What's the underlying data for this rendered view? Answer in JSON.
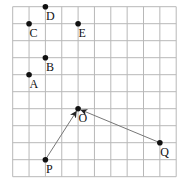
{
  "diagram": {
    "type": "coordinate-grid",
    "grid": {
      "columns": 10,
      "rows": 10,
      "origin_px": [
        12.7,
        6.7
      ],
      "cell_w": 16.35,
      "cell_h": 17.0,
      "line_color": "#b8b8b8"
    },
    "points": [
      {
        "label": "D",
        "col": 2,
        "row": 0
      },
      {
        "label": "C",
        "col": 1,
        "row": 1
      },
      {
        "label": "E",
        "col": 4,
        "row": 1
      },
      {
        "label": "B",
        "col": 2,
        "row": 3
      },
      {
        "label": "A",
        "col": 1,
        "row": 4
      },
      {
        "label": "O",
        "col": 4,
        "row": 6
      },
      {
        "label": "Q",
        "col": 9,
        "row": 8
      },
      {
        "label": "P",
        "col": 2,
        "row": 9
      }
    ],
    "arrows": [
      {
        "from": "P",
        "to": "O"
      },
      {
        "from": "Q",
        "to": "O"
      }
    ],
    "colors": {
      "point": "#111111",
      "arrow": "#777777",
      "label": "#111111"
    }
  }
}
